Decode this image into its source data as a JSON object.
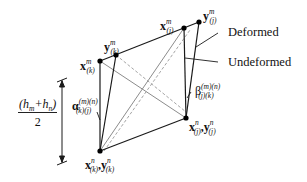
{
  "diagram": {
    "legend": {
      "deformed": "Deformed",
      "undeformed": "Undeformed"
    },
    "nodes": {
      "xkm": {
        "base": "x",
        "sup": "m",
        "sub": "(k)"
      },
      "ykm": {
        "base": "y",
        "sup": "m",
        "sub": "(k)"
      },
      "xjm": {
        "base": "x",
        "sup": "m",
        "sub": "(j)"
      },
      "yjm": {
        "base": "y",
        "sup": "m",
        "sub": "(j)"
      },
      "xkn_ykn": {
        "base1": "x",
        "sup1": "n",
        "sub1": "(k)",
        "sep": ",",
        "base2": "y",
        "sup2": "n",
        "sub2": "(k)"
      },
      "xjn_yjn": {
        "base1": "x",
        "sup1": "n",
        "sub1": "(j)",
        "sep": ",",
        "base2": "y",
        "sup2": "n",
        "sub2": "(j)"
      }
    },
    "angles": {
      "alpha": {
        "symbol": "α",
        "sup": "(m)(n)",
        "sub": "(k)(j)"
      },
      "beta": {
        "symbol": "β",
        "sup": "(m)(n)",
        "sub": "(j)(k)"
      }
    },
    "dimension": {
      "numerator_open": "(h",
      "numerator_sub1": "m",
      "numerator_plus": "+h",
      "numerator_sub2": "n",
      "numerator_close": ")",
      "denominator": "2"
    },
    "colors": {
      "deformed_line": "#1a1a1a",
      "undeformed_line": "#8c8c8c",
      "dashed_line": "#9a9a9a",
      "node": "#000000"
    }
  }
}
